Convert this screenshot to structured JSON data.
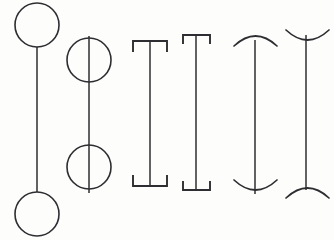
{
  "canvas": {
    "title": "Line terminator shapes",
    "width": 334,
    "height": 240,
    "background_color": "#fdfdfc",
    "stroke_color": "#2e2e32"
  },
  "figures": [
    {
      "id": "figure-1",
      "name": "line-with-tangent-circles",
      "label": "Vertical line capped by tangent circles",
      "stem": {
        "x": 37,
        "y1": 47,
        "y2": 192
      },
      "top_cap": {
        "type": "circle",
        "cx": 37,
        "cy": 25,
        "r": 22
      },
      "bottom_cap": {
        "type": "circle",
        "cx": 37,
        "cy": 214,
        "r": 22
      }
    },
    {
      "id": "figure-2",
      "name": "line-through-circles",
      "label": "Vertical line passing through two circles",
      "stem": {
        "x": 89,
        "y1": 36,
        "y2": 193
      },
      "top_cap": {
        "type": "circle",
        "cx": 89,
        "cy": 60,
        "r": 22
      },
      "bottom_cap": {
        "type": "circle",
        "cx": 89,
        "cy": 167,
        "r": 22
      }
    },
    {
      "id": "figure-3",
      "name": "wide-i-beam",
      "label": "Wide I-beam with inward serifs",
      "stem": {
        "x": 150,
        "y1": 41,
        "y2": 186
      },
      "top_cap": {
        "type": "bar",
        "x1": 133,
        "x2": 167,
        "y": 41,
        "serif_length": 11,
        "serif_direction": "down"
      },
      "bottom_cap": {
        "type": "bar",
        "x1": 133,
        "x2": 167,
        "y": 186,
        "serif_length": 11,
        "serif_direction": "up"
      }
    },
    {
      "id": "figure-4",
      "name": "narrow-i-beam",
      "label": "Narrow I-beam with inward serifs",
      "stem": {
        "x": 196,
        "y1": 35,
        "y2": 190
      },
      "top_cap": {
        "type": "bar",
        "x1": 183,
        "x2": 210,
        "y": 35,
        "serif_length": 9,
        "serif_direction": "down"
      },
      "bottom_cap": {
        "type": "bar",
        "x1": 183,
        "x2": 210,
        "y": 190,
        "serif_length": 9,
        "serif_direction": "up"
      }
    },
    {
      "id": "figure-5",
      "name": "dome-top-cup-bottom",
      "label": "Vertical line with dome above and cup below",
      "stem": {
        "x": 255,
        "y1": 40,
        "y2": 194
      },
      "top_cap": {
        "type": "arc",
        "x1": 234,
        "x2": 277,
        "y": 46,
        "sagitta": 10,
        "curve": "dome"
      },
      "bottom_cap": {
        "type": "arc",
        "x1": 234,
        "x2": 277,
        "y": 180,
        "sagitta": 10,
        "curve": "cup"
      }
    },
    {
      "id": "figure-6",
      "name": "cup-top-dome-bottom",
      "label": "Vertical line with cup above and dome below",
      "stem": {
        "x": 306,
        "y1": 35,
        "y2": 190
      },
      "top_cap": {
        "type": "arc",
        "x1": 286,
        "x2": 329,
        "y": 30,
        "sagitta": 10,
        "curve": "cup"
      },
      "bottom_cap": {
        "type": "arc",
        "x1": 286,
        "x2": 329,
        "y": 198,
        "sagitta": 10,
        "curve": "dome"
      }
    }
  ]
}
